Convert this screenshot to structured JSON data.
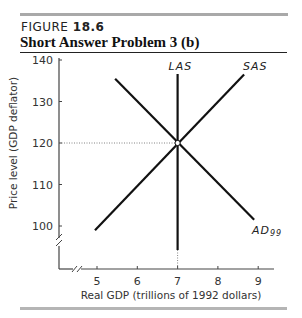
{
  "figure": {
    "label_prefix": "FIGURE",
    "label_number": "18.6",
    "title": "Short Answer Problem 3 (b)"
  },
  "chart_data": {
    "type": "line",
    "title": "Short Answer Problem 3 (b)",
    "xlabel": "Real GDP (trillions of 1992 dollars)",
    "ylabel": "Price level (GDP deflator)",
    "xlim": [
      4,
      9.5
    ],
    "ylim": [
      95,
      140
    ],
    "x_ticks": [
      5,
      6,
      7,
      8,
      9
    ],
    "y_ticks": [
      100,
      110,
      120,
      130,
      140
    ],
    "axis_breaks": [
      "x",
      "y"
    ],
    "grid": false,
    "series": [
      {
        "name": "LAS",
        "points": [
          [
            7,
            136
          ],
          [
            7,
            94
          ]
        ]
      },
      {
        "name": "SAS",
        "points": [
          [
            4.95,
            99
          ],
          [
            8.65,
            136.5
          ]
        ]
      },
      {
        "name": "AD99",
        "points": [
          [
            5.45,
            135.5
          ],
          [
            8.9,
            101.5
          ]
        ]
      }
    ],
    "annotations": [
      {
        "type": "equilibrium_point",
        "x": 7,
        "y": 120
      },
      {
        "type": "dotted_guide",
        "from": [
          4,
          120
        ],
        "to": [
          7,
          120
        ]
      },
      {
        "type": "dotted_guide",
        "from": [
          7,
          95
        ],
        "to": [
          7,
          94
        ]
      }
    ],
    "labels": {
      "LAS": "LAS",
      "SAS": "SAS",
      "AD": "AD",
      "AD_sub": "99"
    }
  }
}
